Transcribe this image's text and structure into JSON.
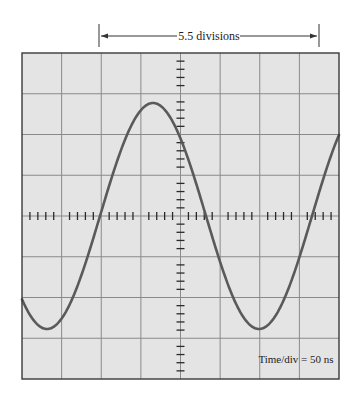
{
  "measurement": {
    "label": "5.5  divisions",
    "start_division": 2,
    "span_divisions": 5.5
  },
  "scope": {
    "time_div_label": "Time/div = 50  ns",
    "divisions_x": 8,
    "divisions_y": 8,
    "minor_ticks_per_division": 5
  },
  "waveform": {
    "type": "sine",
    "rising_zero_px": 100,
    "period_px": 212,
    "amplitude_px": 113
  },
  "colors": {
    "screen_bg": "#e4e4e4",
    "grid": "#8a8a8a",
    "border": "#3a3a3a",
    "trace": "#5a5a5a",
    "ticks": "#2a2a2a"
  },
  "chart_data": {
    "type": "line",
    "title": "",
    "xlabel": "Time (divisions, 50 ns/div)",
    "ylabel": "Amplitude (divisions)",
    "xlim": [
      0,
      8
    ],
    "ylim": [
      -4,
      4
    ],
    "grid": true,
    "annotations": [
      "5.5  divisions",
      "Time/div = 50  ns"
    ],
    "series": [
      {
        "name": "sine wave",
        "x": [
          0,
          0.62,
          1.95,
          3.27,
          4.6,
          5.92,
          7.25,
          8
        ],
        "y": [
          -2.0,
          -2.8,
          0,
          2.8,
          0,
          -2.8,
          0,
          1.9
        ]
      }
    ]
  }
}
